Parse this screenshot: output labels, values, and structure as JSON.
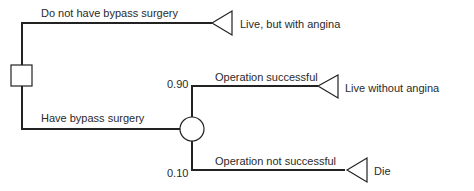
{
  "diagram": {
    "type": "decision_tree",
    "decision_node": {
      "shape": "square"
    },
    "branches": {
      "no_surgery": {
        "label": "Do not have bypass surgery",
        "outcome": "Live, but with angina"
      },
      "surgery": {
        "label": "Have bypass surgery"
      }
    },
    "chance_node": {
      "shape": "circle",
      "outcomes": [
        {
          "label": "Operation successful",
          "probability": "0.90",
          "outcome": "Live without angina"
        },
        {
          "label": "Operation not successful",
          "probability": "0.10",
          "outcome": "Die"
        }
      ]
    },
    "colors": {
      "line": "#222222",
      "background": "#ffffff"
    }
  }
}
